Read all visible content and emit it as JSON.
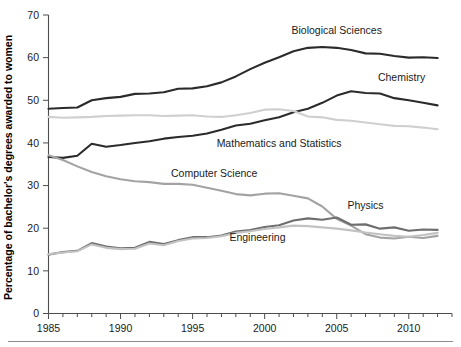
{
  "chart_data": {
    "type": "line",
    "title": "",
    "xlabel": "",
    "ylabel": "Percentage of bachelor's degrees awarded to women",
    "xlim": [
      1985,
      2013
    ],
    "ylim": [
      0,
      70
    ],
    "yticks": [
      0,
      10,
      20,
      30,
      40,
      50,
      60,
      70
    ],
    "xticks": [
      1985,
      1990,
      1995,
      2000,
      2005,
      2010
    ],
    "xtick_labels": [
      "1985",
      "1990",
      "1995",
      "2000",
      "2005",
      "2010"
    ],
    "ytick_labels": [
      "0",
      "10",
      "20",
      "30",
      "40",
      "50",
      "60",
      "70"
    ],
    "x_minor_tick_step": 1,
    "grid": false,
    "legend": "inline-annotations",
    "x": [
      1985,
      1986,
      1987,
      1988,
      1989,
      1990,
      1991,
      1992,
      1993,
      1994,
      1995,
      1996,
      1997,
      1998,
      1999,
      2000,
      2001,
      2002,
      2003,
      2004,
      2005,
      2006,
      2007,
      2008,
      2009,
      2010,
      2011,
      2012
    ],
    "series": [
      {
        "name": "Biological Sciences",
        "color": "#2b2b2b",
        "width": 2.1,
        "label_x": 2005,
        "label_y": 65.5,
        "values": [
          48.0,
          48.2,
          48.3,
          50.0,
          50.5,
          50.8,
          51.5,
          51.6,
          51.9,
          52.7,
          52.8,
          53.3,
          54.2,
          55.6,
          57.3,
          58.8,
          60.1,
          61.5,
          62.3,
          62.5,
          62.3,
          61.8,
          61.0,
          60.9,
          60.4,
          60.0,
          60.1,
          59.9
        ],
        "start_value": 48.0,
        "end_value": 59.9,
        "peak_value": 62.5,
        "peak_year": 2004
      },
      {
        "name": "Chemistry",
        "color": "#2b2b2b",
        "width": 2.1,
        "label_x": 2009.5,
        "label_y": 54.5,
        "values": [
          36.7,
          36.5,
          37.0,
          39.8,
          39.1,
          39.5,
          40.0,
          40.4,
          41.0,
          41.4,
          41.7,
          42.2,
          43.1,
          44.1,
          44.5,
          45.3,
          46.0,
          47.2,
          48.0,
          49.4,
          51.1,
          52.1,
          51.7,
          51.6,
          50.5,
          50.0,
          49.4,
          48.8
        ],
        "start_value": 36.7,
        "end_value": 48.8,
        "peak_value": 52.1,
        "peak_year": 2006
      },
      {
        "name": "Mathematics and Statistics",
        "color": "#cfcfcf",
        "width": 2.1,
        "label_x": 2001,
        "label_y": 39.0,
        "values": [
          46.1,
          45.9,
          46.0,
          46.1,
          46.3,
          46.4,
          46.5,
          46.5,
          46.3,
          46.4,
          46.5,
          46.2,
          46.1,
          46.5,
          47.0,
          47.8,
          47.9,
          47.5,
          46.2,
          46.0,
          45.4,
          45.2,
          44.8,
          44.4,
          44.0,
          43.9,
          43.6,
          43.2
        ],
        "start_value": 46.1,
        "end_value": 43.2,
        "peak_value": 47.9,
        "peak_year": 2001
      },
      {
        "name": "Computer Science",
        "color": "#a3a3a3",
        "width": 2.1,
        "label_x": 1996.5,
        "label_y": 32.0,
        "values": [
          37.1,
          36.0,
          34.5,
          33.2,
          32.2,
          31.5,
          31.0,
          30.8,
          30.4,
          30.4,
          30.2,
          29.5,
          28.8,
          28.0,
          27.7,
          28.1,
          28.2,
          27.6,
          27.0,
          25.1,
          22.2,
          20.6,
          18.6,
          17.8,
          17.6,
          18.0,
          17.7,
          18.2
        ],
        "start_value": 37.1,
        "end_value": 18.2,
        "peak_value": 37.1,
        "peak_year": 1985
      },
      {
        "name": "Physics",
        "color": "#6e6e6e",
        "width": 2.1,
        "label_x": 2007,
        "label_y": 24.5,
        "values": [
          13.8,
          14.4,
          14.7,
          16.5,
          15.7,
          15.3,
          15.4,
          16.8,
          16.3,
          17.2,
          17.9,
          17.9,
          18.3,
          19.2,
          19.6,
          20.3,
          20.7,
          21.8,
          22.3,
          22.0,
          22.5,
          20.8,
          20.9,
          19.9,
          20.2,
          19.4,
          19.7,
          19.6
        ],
        "start_value": 13.8,
        "end_value": 19.6,
        "peak_value": 22.5,
        "peak_year": 2005
      },
      {
        "name": "Engineering",
        "color": "#c2c2c2",
        "width": 2.1,
        "label_x": 1999.5,
        "label_y": 17.0,
        "values": [
          13.9,
          14.3,
          14.6,
          16.2,
          15.4,
          15.1,
          15.2,
          16.4,
          16.0,
          17.0,
          17.6,
          17.7,
          18.1,
          18.9,
          19.3,
          19.8,
          20.2,
          20.6,
          20.5,
          20.2,
          19.9,
          19.5,
          19.0,
          18.6,
          18.2,
          18.0,
          18.4,
          18.9
        ],
        "start_value": 13.9,
        "end_value": 18.9,
        "peak_value": 20.6,
        "peak_year": 2002
      }
    ]
  },
  "colors": {
    "axis": "#4d4d4d",
    "text": "#1a1a1a",
    "background": "#ffffff",
    "footer_rule": "#8c8c8c"
  }
}
